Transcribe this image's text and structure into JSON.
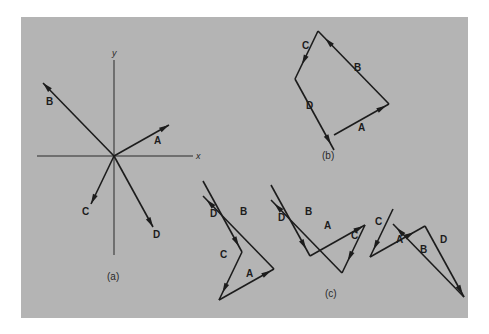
{
  "figure": {
    "background": "#b4b4b4",
    "ink": "#1c1c1c"
  },
  "panel_a": {
    "caption": "(a)",
    "x_axis_label": "x",
    "y_axis_label": "y",
    "vectors": [
      {
        "name": "A",
        "label": "A",
        "dx": 55,
        "dy": 31
      },
      {
        "name": "B",
        "label": "B",
        "dx": -71,
        "dy": 73
      },
      {
        "name": "C",
        "label": "C",
        "dx": -23,
        "dy": -48
      },
      {
        "name": "D",
        "label": "D",
        "dx": 39,
        "dy": -71
      }
    ]
  },
  "panel_b": {
    "caption": "(b)",
    "description": "Head-to-tail sum A + B + C + D forming a closed polygon",
    "order": [
      "A",
      "B",
      "C",
      "D"
    ],
    "labels": {
      "A": "A",
      "B": "B",
      "C": "C",
      "D": "D"
    }
  },
  "panel_c": {
    "caption": "(c)",
    "description": "Same vectors added in different orders, each forming a closed polygon",
    "polygons": [
      {
        "order": [
          "D",
          "C",
          "A",
          "B"
        ],
        "labels": {
          "A": "A",
          "B": "B",
          "C": "C",
          "D": "D"
        }
      },
      {
        "order": [
          "D",
          "A",
          "C",
          "B"
        ],
        "labels": {
          "A": "A",
          "B": "B",
          "C": "C",
          "D": "D"
        }
      },
      {
        "order": [
          "C",
          "A",
          "D",
          "B"
        ],
        "labels": {
          "A": "A",
          "B": "B",
          "C": "C",
          "D": "D"
        }
      }
    ]
  }
}
